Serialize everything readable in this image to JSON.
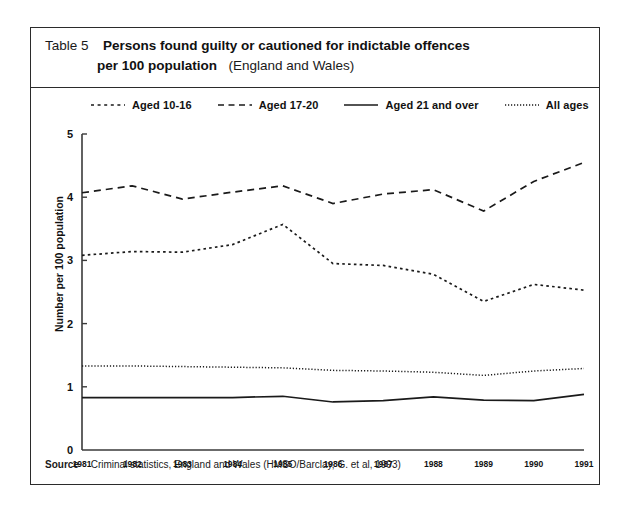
{
  "table": {
    "number_label": "Table 5",
    "title_bold_line1": "Persons found guilty or cautioned for indictable offences",
    "title_bold_line2": "per 100 population",
    "title_light_suffix": "(England and Wales)"
  },
  "source": {
    "label": "Source",
    "text": "Criminal statistics, England and Wales (HMSO/Barclay, G. et al, 1993)"
  },
  "colors": {
    "ink": "#1a1a1a",
    "frame": "#2b2b2b",
    "axis": "#3a3a3a",
    "series": "#1a1a1a"
  },
  "chart_data": {
    "type": "line",
    "title": "Persons found guilty or cautioned for indictable offences per 100 population (England and Wales)",
    "xlabel": "",
    "ylabel": "Number per 100 population",
    "ylim": [
      0,
      5
    ],
    "yticks": [
      0,
      1,
      2,
      3,
      4,
      5
    ],
    "ytick_labels": [
      "0",
      "1",
      "2",
      "3",
      "4",
      "5"
    ],
    "grid": false,
    "legend_position": "top",
    "categories": [
      "1981",
      "1982",
      "1983",
      "1984",
      "1985",
      "1986",
      "1987",
      "1988",
      "1989",
      "1990",
      "1991"
    ],
    "series": [
      {
        "name": "Aged 10-16",
        "style": "dotted",
        "values": [
          3.08,
          3.14,
          3.13,
          3.25,
          3.57,
          2.95,
          2.92,
          2.78,
          2.35,
          2.62,
          2.53
        ]
      },
      {
        "name": "Aged 17-20",
        "style": "dashed",
        "values": [
          4.07,
          4.18,
          3.97,
          4.08,
          4.18,
          3.9,
          4.05,
          4.12,
          3.78,
          4.25,
          4.55
        ]
      },
      {
        "name": "Aged 21 and over",
        "style": "solid",
        "values": [
          0.83,
          0.83,
          0.83,
          0.83,
          0.85,
          0.76,
          0.78,
          0.84,
          0.79,
          0.78,
          0.88
        ]
      },
      {
        "name": "All ages",
        "style": "fine-dotted",
        "values": [
          1.33,
          1.33,
          1.32,
          1.31,
          1.3,
          1.26,
          1.25,
          1.23,
          1.18,
          1.25,
          1.29
        ]
      }
    ]
  }
}
